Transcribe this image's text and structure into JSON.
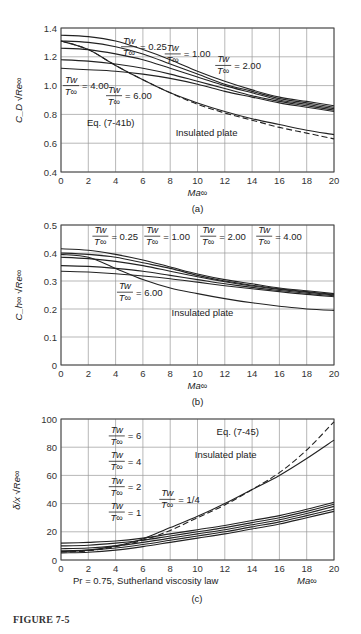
{
  "figure_label": "FIGURE 7-5",
  "chart_data": [
    {
      "id": "a",
      "panel_label": "(a)",
      "type": "line",
      "xlabel": "Ma∞",
      "ylabel": "C_D √Re∞",
      "xlim": [
        0,
        20
      ],
      "ylim": [
        0.4,
        1.4
      ],
      "xticks": [
        0,
        2,
        4,
        6,
        8,
        10,
        12,
        14,
        16,
        18,
        20
      ],
      "yticks": [
        0.4,
        0.6,
        0.8,
        1.0,
        1.2,
        1.4
      ],
      "ytick_labels": [
        "0.4",
        "0.6",
        "0.8",
        "1.0",
        "1.2",
        "1.4"
      ],
      "grid": true,
      "x": [
        0,
        2,
        4,
        6,
        8,
        10,
        12,
        14,
        16,
        18,
        20
      ],
      "series": [
        {
          "name": "Tw/T∞ = 0.25",
          "values": [
            1.35,
            1.34,
            1.31,
            1.25,
            1.18,
            1.1,
            1.03,
            0.97,
            0.92,
            0.89,
            0.86
          ],
          "style": "solid"
        },
        {
          "name": "Tw/T∞ = 1.00",
          "values": [
            1.31,
            1.3,
            1.27,
            1.22,
            1.15,
            1.08,
            1.01,
            0.96,
            0.91,
            0.88,
            0.85
          ],
          "style": "solid"
        },
        {
          "name": "Tw/T∞ = 2.00",
          "values": [
            1.26,
            1.25,
            1.22,
            1.18,
            1.12,
            1.06,
            1.0,
            0.95,
            0.9,
            0.87,
            0.84
          ],
          "style": "solid"
        },
        {
          "name": "Tw/T∞ = 4.00",
          "values": [
            1.18,
            1.17,
            1.15,
            1.12,
            1.08,
            1.03,
            0.98,
            0.93,
            0.89,
            0.86,
            0.83
          ],
          "style": "solid"
        },
        {
          "name": "Tw/T∞ = 6.00",
          "values": [
            1.12,
            1.11,
            1.1,
            1.08,
            1.05,
            1.01,
            0.96,
            0.92,
            0.88,
            0.85,
            0.82
          ],
          "style": "solid"
        },
        {
          "name": "Insulated plate",
          "values": [
            1.31,
            1.25,
            1.14,
            1.04,
            0.95,
            0.88,
            0.82,
            0.77,
            0.73,
            0.69,
            0.66
          ],
          "style": "solid"
        },
        {
          "name": "Eq. (7-41b)",
          "values": [
            1.31,
            1.25,
            1.14,
            1.04,
            0.95,
            0.87,
            0.81,
            0.76,
            0.71,
            0.67,
            0.63
          ],
          "style": "dashed"
        }
      ],
      "annotations": [
        {
          "text_num": "Tw",
          "text_den": "T∞",
          "value": "= 0.25",
          "pos": [
            4.4,
            1.27
          ]
        },
        {
          "text_num": "Tw",
          "text_den": "T∞",
          "value": "= 1.00",
          "pos": [
            7.6,
            1.22
          ]
        },
        {
          "text_num": "Tw",
          "text_den": "T∞",
          "value": "= 2.00",
          "pos": [
            11.3,
            1.14
          ]
        },
        {
          "text_num": "Tw",
          "text_den": "T∞",
          "value": "= 4.00",
          "pos": [
            0.15,
            1.0
          ]
        },
        {
          "text_num": "Tw",
          "text_den": "T∞",
          "value": "= 6.00",
          "pos": [
            3.3,
            0.93
          ]
        },
        {
          "text": "Eq. (7-41b)",
          "pos": [
            1.9,
            0.72
          ]
        },
        {
          "text": "Insulated plate",
          "pos": [
            8.4,
            0.65
          ]
        }
      ]
    },
    {
      "id": "b",
      "panel_label": "(b)",
      "type": "line",
      "xlabel": "Ma∞",
      "ylabel": "C_h∞ √Re∞",
      "xlim": [
        0,
        20
      ],
      "ylim": [
        0,
        0.5
      ],
      "xticks": [
        0,
        2,
        4,
        6,
        8,
        10,
        12,
        14,
        16,
        18,
        20
      ],
      "yticks": [
        0,
        0.1,
        0.2,
        0.3,
        0.4,
        0.5
      ],
      "ytick_labels": [
        "0",
        "0.1",
        "0.2",
        "0.3",
        "0.4",
        "0.5"
      ],
      "grid": true,
      "x": [
        0,
        2,
        4,
        6,
        8,
        10,
        12,
        14,
        16,
        18,
        20
      ],
      "series": [
        {
          "name": "Tw/T∞ = 0.25",
          "values": [
            0.415,
            0.41,
            0.395,
            0.375,
            0.35,
            0.325,
            0.305,
            0.29,
            0.275,
            0.265,
            0.255
          ],
          "style": "solid"
        },
        {
          "name": "Tw/T∞ = 1.00",
          "values": [
            0.4,
            0.395,
            0.385,
            0.365,
            0.345,
            0.32,
            0.3,
            0.285,
            0.272,
            0.262,
            0.252
          ],
          "style": "solid"
        },
        {
          "name": "Tw/T∞ = 2.00",
          "values": [
            0.385,
            0.38,
            0.37,
            0.355,
            0.335,
            0.315,
            0.297,
            0.282,
            0.27,
            0.26,
            0.25
          ],
          "style": "solid"
        },
        {
          "name": "Tw/T∞ = 4.00",
          "values": [
            0.355,
            0.352,
            0.345,
            0.335,
            0.32,
            0.305,
            0.29,
            0.277,
            0.266,
            0.256,
            0.247
          ],
          "style": "solid"
        },
        {
          "name": "Tw/T∞ = 6.00",
          "values": [
            0.335,
            0.332,
            0.326,
            0.318,
            0.308,
            0.296,
            0.283,
            0.272,
            0.262,
            0.252,
            0.244
          ],
          "style": "solid"
        },
        {
          "name": "Insulated plate",
          "values": [
            0.395,
            0.385,
            0.345,
            0.305,
            0.275,
            0.255,
            0.237,
            0.222,
            0.21,
            0.2,
            0.195
          ],
          "style": "solid"
        }
      ],
      "annotations": [
        {
          "text_num": "Tw",
          "text_den": "T∞",
          "value": "= 0.25",
          "pos": [
            2.3,
            0.46
          ]
        },
        {
          "text_num": "Tw",
          "text_den": "T∞",
          "value": "= 1.00",
          "pos": [
            6.1,
            0.46
          ]
        },
        {
          "text_num": "Tw",
          "text_den": "T∞",
          "value": "= 2.00",
          "pos": [
            10.2,
            0.46
          ]
        },
        {
          "text_num": "Tw",
          "text_den": "T∞",
          "value": "= 4.00",
          "pos": [
            14.3,
            0.46
          ]
        },
        {
          "text_num": "Tw",
          "text_den": "T∞",
          "value": "= 6.00",
          "pos": [
            4.1,
            0.26
          ]
        },
        {
          "text": "Insulated plate",
          "pos": [
            8.1,
            0.175
          ]
        }
      ]
    },
    {
      "id": "c",
      "panel_label": "(c)",
      "type": "line",
      "xlabel": "Ma∞",
      "ylabel": "δ/x √Re∞",
      "note": "Pr = 0.75, Sutherland viscosity law",
      "xlim": [
        0,
        20
      ],
      "ylim": [
        0,
        100
      ],
      "xticks": [
        0,
        2,
        4,
        6,
        8,
        10,
        12,
        14,
        16,
        18,
        20
      ],
      "yticks": [
        0,
        20,
        40,
        60,
        80,
        100
      ],
      "ytick_labels": [
        "0",
        "20",
        "40",
        "60",
        "80",
        "100"
      ],
      "grid": true,
      "x": [
        0,
        2,
        4,
        6,
        8,
        10,
        12,
        14,
        16,
        18,
        20
      ],
      "series": [
        {
          "name": "Tw/T∞ = 6",
          "values": [
            12,
            12.5,
            13.5,
            15.5,
            18.5,
            21.5,
            24.5,
            28,
            31.5,
            36,
            41
          ],
          "style": "solid"
        },
        {
          "name": "Tw/T∞ = 4",
          "values": [
            10,
            10.5,
            12,
            14,
            17,
            20,
            23,
            26.5,
            30,
            34.5,
            39.5
          ],
          "style": "solid"
        },
        {
          "name": "Tw/T∞ = 2",
          "values": [
            8,
            8.5,
            10,
            12.5,
            15.5,
            18.5,
            21.5,
            25,
            28.5,
            33,
            38
          ],
          "style": "solid"
        },
        {
          "name": "Tw/T∞ = 1",
          "values": [
            6.5,
            7,
            8.5,
            11,
            14,
            17,
            20,
            23.5,
            27,
            31.5,
            36
          ],
          "style": "solid"
        },
        {
          "name": "Tw/T∞ = 1/4",
          "values": [
            5,
            5.5,
            7,
            9.5,
            12.5,
            15.5,
            18.5,
            22,
            25.5,
            30,
            34.5
          ],
          "style": "solid"
        },
        {
          "name": "Insulated plate",
          "values": [
            6,
            7,
            10,
            15,
            23,
            31,
            40,
            50,
            60,
            72,
            85
          ],
          "style": "solid"
        },
        {
          "name": "Eq. (7-45)",
          "values": [
            5.5,
            6.5,
            9.5,
            14,
            21,
            30,
            39,
            50,
            62,
            78,
            98
          ],
          "style": "dashed"
        }
      ],
      "annotations": [
        {
          "text_num": "Tw",
          "text_den": "T∞",
          "value": "= 6",
          "pos": [
            3.5,
            88
          ]
        },
        {
          "text_num": "Tw",
          "text_den": "T∞",
          "value": "= 4",
          "pos": [
            3.5,
            70
          ]
        },
        {
          "text_num": "Tw",
          "text_den": "T∞",
          "value": "= 2",
          "pos": [
            3.5,
            52
          ]
        },
        {
          "text_num": "Tw",
          "text_den": "T∞",
          "value": "= 1",
          "pos": [
            3.5,
            34
          ]
        },
        {
          "text_num": "Tw",
          "text_den": "T∞",
          "value": "= 1/4",
          "pos": [
            7.2,
            43
          ]
        },
        {
          "text": "Eq. (7-45)",
          "pos": [
            11.4,
            89
          ]
        },
        {
          "text": "Insulated plate",
          "pos": [
            9.8,
            72
          ]
        }
      ]
    }
  ]
}
